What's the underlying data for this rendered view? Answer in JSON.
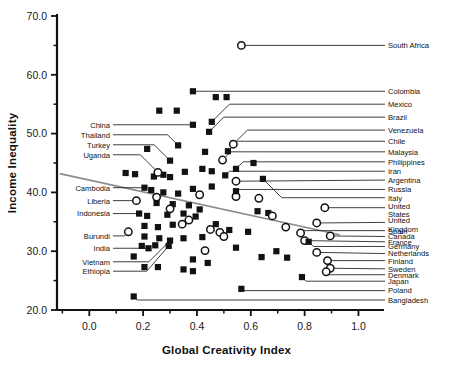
{
  "chart_data": {
    "type": "scatter",
    "title": "",
    "xlabel": "Global Creativity Index",
    "ylabel": "Income Inequality",
    "xlim": [
      -0.12,
      1.08
    ],
    "ylim": [
      20.0,
      70.0
    ],
    "grid": false,
    "legend_position": "none",
    "x_ticks": [
      0.0,
      0.2,
      0.4,
      0.6,
      0.8,
      1.0
    ],
    "x_tick_labels": [
      "0.0",
      "0.2",
      "0.4",
      "0.6",
      "0.8",
      "1.0"
    ],
    "x_minor_ticks": [
      -0.1,
      0.1,
      0.3,
      0.5,
      0.7,
      0.9
    ],
    "y_ticks": [
      20.0,
      30.0,
      40.0,
      50.0,
      60.0,
      70.0
    ],
    "y_tick_labels": [
      "20.0",
      "30.0",
      "40.0",
      "50.0",
      "60.0",
      "70.0"
    ],
    "y_minor_ticks": [
      25.0,
      35.0,
      45.0,
      55.0,
      65.0
    ],
    "marker_styles": {
      "filled_square": "solid black square",
      "open_circle": "white circle with black outline"
    },
    "trendline": {
      "type": "linear_fit",
      "color": "#8c8c8c",
      "x_start": -0.11,
      "y_start": 43.2,
      "x_end": 0.93,
      "y_end": 32.8
    },
    "labeled_points": [
      {
        "name": "South Africa",
        "x": 0.565,
        "y": 65.0,
        "marker": "open_circle",
        "side": "right",
        "label_y": 65.0
      },
      {
        "name": "Colombia",
        "x": 0.385,
        "y": 57.2,
        "marker": "filled_square",
        "side": "right",
        "label_y": 57.2
      },
      {
        "name": "Mexico",
        "x": 0.455,
        "y": 52.0,
        "marker": "filled_square",
        "side": "right",
        "label_y": 55.0
      },
      {
        "name": "Brazil",
        "x": 0.445,
        "y": 50.3,
        "marker": "filled_square",
        "side": "right",
        "label_y": 52.8
      },
      {
        "name": "Venezuela",
        "x": 0.535,
        "y": 48.2,
        "marker": "open_circle",
        "side": "right",
        "label_y": 50.6
      },
      {
        "name": "Chile",
        "x": 0.515,
        "y": 47.0,
        "marker": "filled_square",
        "side": "right",
        "label_y": 48.7
      },
      {
        "name": "Malaysia",
        "x": 0.495,
        "y": 45.5,
        "marker": "open_circle",
        "side": "right",
        "label_y": 46.9
      },
      {
        "name": "Philippines",
        "x": 0.545,
        "y": 44.0,
        "marker": "filled_square",
        "side": "right",
        "label_y": 45.2
      },
      {
        "name": "Iran",
        "x": 0.505,
        "y": 42.9,
        "marker": "filled_square",
        "side": "right",
        "label_y": 43.6
      },
      {
        "name": "Argentina",
        "x": 0.545,
        "y": 41.9,
        "marker": "open_circle",
        "side": "right",
        "label_y": 42.1
      },
      {
        "name": "Russia",
        "x": 0.545,
        "y": 40.2,
        "marker": "filled_square",
        "side": "right",
        "label_y": 40.5
      },
      {
        "name": "Italy",
        "x": 0.645,
        "y": 42.3,
        "marker": "filled_square",
        "side": "right",
        "label_y": 39.1
      },
      {
        "name": "United States",
        "x": 0.875,
        "y": 37.4,
        "marker": "open_circle",
        "side": "right",
        "label_y": 37.4
      },
      {
        "name": "United Kingdom",
        "x": 0.845,
        "y": 34.8,
        "marker": "open_circle",
        "side": "right",
        "label_y": 34.9
      },
      {
        "name": "Spain",
        "x": 0.785,
        "y": 33.1,
        "marker": "open_circle",
        "side": "right",
        "label_y": 33.5
      },
      {
        "name": "Canada",
        "x": 0.895,
        "y": 32.6,
        "marker": "open_circle",
        "side": "right",
        "label_y": 32.5
      },
      {
        "name": "France",
        "x": 0.8,
        "y": 31.8,
        "marker": "open_circle",
        "side": "right",
        "label_y": 31.6
      },
      {
        "name": "Germany",
        "x": 0.815,
        "y": 31.6,
        "marker": "filled_square",
        "side": "right",
        "label_y": 30.8
      },
      {
        "name": "Netherlands",
        "x": 0.845,
        "y": 29.8,
        "marker": "open_circle",
        "side": "right",
        "label_y": 29.6
      },
      {
        "name": "Finland",
        "x": 0.885,
        "y": 28.4,
        "marker": "open_circle",
        "side": "right",
        "label_y": 28.4
      },
      {
        "name": "Sweden",
        "x": 0.895,
        "y": 27.1,
        "marker": "open_circle",
        "side": "right",
        "label_y": 27.0
      },
      {
        "name": "Denmark",
        "x": 0.88,
        "y": 26.5,
        "marker": "open_circle",
        "side": "right",
        "label_y": 26.0
      },
      {
        "name": "Japan",
        "x": 0.79,
        "y": 25.6,
        "marker": "filled_square",
        "side": "right",
        "label_y": 24.9
      },
      {
        "name": "Poland",
        "x": 0.565,
        "y": 23.6,
        "marker": "filled_square",
        "side": "right",
        "label_y": 23.3
      },
      {
        "name": "Bangladesh",
        "x": 0.165,
        "y": 22.3,
        "marker": "filled_square",
        "side": "right",
        "label_y": 21.7
      },
      {
        "name": "China",
        "x": 0.385,
        "y": 51.5,
        "marker": "filled_square",
        "side": "left",
        "label_y": 51.5
      },
      {
        "name": "Thailand",
        "x": 0.33,
        "y": 48.0,
        "marker": "filled_square",
        "side": "left",
        "label_y": 49.8
      },
      {
        "name": "Turkey",
        "x": 0.3,
        "y": 45.4,
        "marker": "filled_square",
        "side": "left",
        "label_y": 48.1
      },
      {
        "name": "Uganda",
        "x": 0.255,
        "y": 43.4,
        "marker": "open_circle",
        "side": "left",
        "label_y": 46.4
      },
      {
        "name": "Cambodia",
        "x": 0.205,
        "y": 40.8,
        "marker": "filled_square",
        "side": "left",
        "label_y": 40.8
      },
      {
        "name": "Liberia",
        "x": 0.175,
        "y": 38.6,
        "marker": "open_circle",
        "side": "left",
        "label_y": 38.6
      },
      {
        "name": "Indonesia",
        "x": 0.185,
        "y": 36.4,
        "marker": "filled_square",
        "side": "left",
        "label_y": 36.4
      },
      {
        "name": "Burundi",
        "x": 0.145,
        "y": 33.3,
        "marker": "open_circle",
        "side": "left",
        "label_y": 32.6
      },
      {
        "name": "India",
        "x": 0.22,
        "y": 30.5,
        "marker": "filled_square",
        "side": "left",
        "label_y": 30.5
      },
      {
        "name": "Vietnam",
        "x": 0.3,
        "y": 31.8,
        "marker": "filled_square",
        "side": "left",
        "label_y": 28.2
      },
      {
        "name": "Ethiopia",
        "x": 0.295,
        "y": 30.9,
        "marker": "filled_square",
        "side": "left",
        "label_y": 26.6
      }
    ],
    "unlabeled_squares": [
      {
        "x": 0.26,
        "y": 53.9
      },
      {
        "x": 0.325,
        "y": 53.9
      },
      {
        "x": 0.47,
        "y": 56.2
      },
      {
        "x": 0.51,
        "y": 56.2
      },
      {
        "x": 0.215,
        "y": 47.4
      },
      {
        "x": 0.135,
        "y": 43.3
      },
      {
        "x": 0.17,
        "y": 43.1
      },
      {
        "x": 0.24,
        "y": 42.7
      },
      {
        "x": 0.275,
        "y": 43.0
      },
      {
        "x": 0.3,
        "y": 42.6
      },
      {
        "x": 0.355,
        "y": 43.5
      },
      {
        "x": 0.42,
        "y": 44.0
      },
      {
        "x": 0.455,
        "y": 43.6
      },
      {
        "x": 0.23,
        "y": 40.4
      },
      {
        "x": 0.275,
        "y": 40.0
      },
      {
        "x": 0.33,
        "y": 39.8
      },
      {
        "x": 0.385,
        "y": 40.6
      },
      {
        "x": 0.455,
        "y": 41.0
      },
      {
        "x": 0.25,
        "y": 38.2
      },
      {
        "x": 0.31,
        "y": 38.0
      },
      {
        "x": 0.37,
        "y": 37.8
      },
      {
        "x": 0.41,
        "y": 37.1
      },
      {
        "x": 0.625,
        "y": 36.8
      },
      {
        "x": 0.665,
        "y": 36.5
      },
      {
        "x": 0.215,
        "y": 36.0
      },
      {
        "x": 0.29,
        "y": 36.2
      },
      {
        "x": 0.35,
        "y": 36.4
      },
      {
        "x": 0.395,
        "y": 35.9
      },
      {
        "x": 0.47,
        "y": 34.6
      },
      {
        "x": 0.205,
        "y": 34.3
      },
      {
        "x": 0.255,
        "y": 34.1
      },
      {
        "x": 0.31,
        "y": 34.5
      },
      {
        "x": 0.52,
        "y": 33.6
      },
      {
        "x": 0.59,
        "y": 33.3
      },
      {
        "x": 0.205,
        "y": 32.5
      },
      {
        "x": 0.26,
        "y": 32.2
      },
      {
        "x": 0.35,
        "y": 32.2
      },
      {
        "x": 0.42,
        "y": 32.4
      },
      {
        "x": 0.195,
        "y": 30.9
      },
      {
        "x": 0.245,
        "y": 31.0
      },
      {
        "x": 0.64,
        "y": 29.0
      },
      {
        "x": 0.735,
        "y": 28.9
      },
      {
        "x": 0.165,
        "y": 29.1
      },
      {
        "x": 0.385,
        "y": 28.6
      },
      {
        "x": 0.44,
        "y": 28.0
      },
      {
        "x": 0.205,
        "y": 27.3
      },
      {
        "x": 0.255,
        "y": 27.3
      },
      {
        "x": 0.35,
        "y": 26.9
      },
      {
        "x": 0.385,
        "y": 26.6
      },
      {
        "x": 0.695,
        "y": 30.0
      },
      {
        "x": 0.545,
        "y": 30.6
      },
      {
        "x": 0.43,
        "y": 46.9
      },
      {
        "x": 0.61,
        "y": 45.0
      }
    ],
    "unlabeled_circles": [
      {
        "x": 0.41,
        "y": 39.6
      },
      {
        "x": 0.37,
        "y": 35.3
      },
      {
        "x": 0.45,
        "y": 33.7
      },
      {
        "x": 0.485,
        "y": 33.2
      },
      {
        "x": 0.5,
        "y": 32.5
      },
      {
        "x": 0.345,
        "y": 34.6
      },
      {
        "x": 0.25,
        "y": 39.2
      },
      {
        "x": 0.3,
        "y": 37.2
      },
      {
        "x": 0.43,
        "y": 30.1
      },
      {
        "x": 0.545,
        "y": 39.3
      },
      {
        "x": 0.63,
        "y": 39.0
      },
      {
        "x": 0.68,
        "y": 36.0
      },
      {
        "x": 0.73,
        "y": 34.1
      }
    ]
  }
}
